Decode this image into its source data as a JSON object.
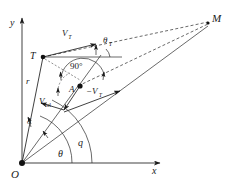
{
  "figure": {
    "type": "vector-kinematics-diagram",
    "axes": {
      "x_label": "x",
      "y_label": "y",
      "origin_label": "O"
    },
    "points": [
      {
        "id": "O",
        "label": "O",
        "role": "origin"
      },
      {
        "id": "T",
        "label": "T",
        "role": "target-position"
      },
      {
        "id": "A",
        "label": "A",
        "role": "interceptor-position"
      },
      {
        "id": "M",
        "label": "M",
        "role": "meeting-point"
      }
    ],
    "vectors": [
      {
        "id": "VT",
        "label": "V",
        "subscript": "T",
        "subscript_style": "italic",
        "role": "target-velocity"
      },
      {
        "id": "negVT",
        "label": "−V",
        "subscript": "T",
        "subscript_style": "italic",
        "role": "negated-target-velocity"
      },
      {
        "id": "Vrel",
        "label": "V",
        "subscript": "rel",
        "subscript_style": "upright",
        "role": "relative-velocity"
      }
    ],
    "angles": [
      {
        "id": "theta_T",
        "label": "θ",
        "subscript": "T",
        "subscript_style": "italic",
        "role": "target-heading-angle"
      },
      {
        "id": "right_angle",
        "label": "90°",
        "subscript": "",
        "subscript_style": "",
        "role": "right-angle-marker"
      },
      {
        "id": "theta",
        "label": "θ",
        "subscript": "",
        "subscript_style": "",
        "role": "line-of-sight-angle"
      },
      {
        "id": "q",
        "label": "q",
        "subscript": "",
        "subscript_style": "",
        "role": "lead-angle"
      },
      {
        "id": "delta",
        "label": "δ",
        "subscript": "",
        "subscript_style": "",
        "role": "small-offset-angle"
      }
    ],
    "lengths": [
      {
        "id": "r",
        "label": "r",
        "role": "range-from-origin-to-target"
      }
    ],
    "colors": {
      "line": "#1f1f1f",
      "dashed": "#2a2a2a",
      "marker": "#111111",
      "background": "#ffffff"
    }
  }
}
